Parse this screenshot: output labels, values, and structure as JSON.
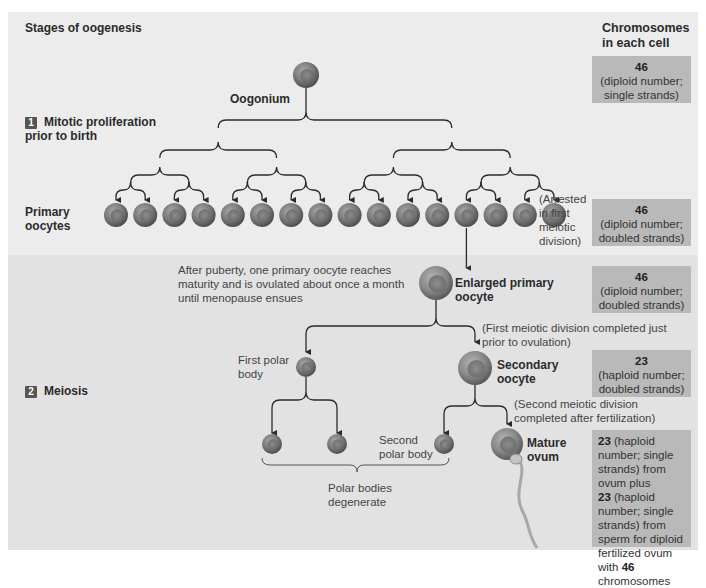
{
  "title": "Stages of oogenesis",
  "chromosomes_header": "Chromosomes in each cell",
  "colors": {
    "panel_top": "#ececec",
    "panel_bottom": "#e2e2e2",
    "chromosome_box": "#b9b9b9",
    "cell": "#7a7a7a",
    "line": "#2b2b2b"
  },
  "stages": [
    {
      "number": "1",
      "label": "Mitotic proliferation prior to birth"
    },
    {
      "number": "2",
      "label": "Meiosis"
    }
  ],
  "cells": {
    "oogonium": "Oogonium",
    "primary_oocytes": "Primary oocytes",
    "primary_oocyte_count": 16,
    "arrested_note": "(Arrested in first meiotic division)",
    "puberty_note": "After puberty, one primary oocyte reaches maturity and is ovulated about once a month until menopause ensues",
    "enlarged_primary_oocyte": "Enlarged primary oocyte",
    "first_meiotic_note": "(First meiotic division completed just prior to ovulation)",
    "first_polar_body": "First polar body",
    "secondary_oocyte": "Secondary oocyte",
    "second_meiotic_note": "(Second meiotic division completed after fertilization)",
    "second_polar_body": "Second polar body",
    "mature_ovum": "Mature ovum",
    "polar_bodies_note": "Polar bodies degenerate"
  },
  "chromosome_boxes": [
    {
      "count": "46",
      "desc": "(diploid number; single strands)"
    },
    {
      "count": "46",
      "desc": "(diploid number; doubled strands)"
    },
    {
      "count": "46",
      "desc": "(diploid number; doubled strands)"
    },
    {
      "count": "23",
      "desc": "(haploid number; doubled strands)"
    }
  ],
  "final_box": {
    "ovum_count": "23",
    "ovum_desc": "(haploid number; single strands) from ovum plus",
    "sperm_count": "23",
    "sperm_desc": "(haploid number; single strands) from sperm for diploid fertilized ovum with",
    "total_count": "46",
    "total_desc": "chromosomes"
  }
}
